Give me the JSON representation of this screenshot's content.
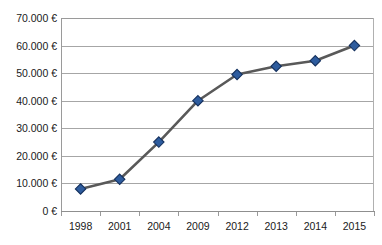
{
  "chart": {
    "title": "",
    "currency_symbol": "€",
    "series_name": "Betrag"
  },
  "chart_data": {
    "type": "line",
    "title": "",
    "xlabel": "",
    "ylabel": "",
    "categories": [
      "1998",
      "2001",
      "2004",
      "2009",
      "2012",
      "2013",
      "2014",
      "2015"
    ],
    "values": [
      8000,
      11500,
      25000,
      40000,
      49500,
      52500,
      54500,
      60000
    ],
    "value_labels": [
      "8.000 €",
      "11.500 €",
      "25.000 €",
      "40.000 €",
      "49.500 €",
      "52.500 €",
      "54.500 €",
      "60.000 €"
    ],
    "ylim": [
      0,
      70000
    ],
    "ytick_values": [
      70000,
      60000,
      50000,
      40000,
      30000,
      20000,
      10000,
      0
    ],
    "ytick_labels": [
      "70.000 €",
      "60.000 €",
      "50.000 €",
      "40.000 €",
      "30.000 €",
      "20.000 €",
      "10.000 €",
      "0 €"
    ],
    "grid": true,
    "grid_axis": "y",
    "legend": false,
    "legend_position": "none",
    "marker": "diamond",
    "series": [
      {
        "name": "Betrag",
        "values": [
          8000,
          11500,
          25000,
          40000,
          49500,
          52500,
          54500,
          60000
        ]
      }
    ]
  },
  "style": {
    "marker_fill": "#2e5c9e",
    "marker_edge": "#15315e",
    "line_color": "#595959",
    "grid_color": "#a6a6a6",
    "axis_color": "#9a9a9a",
    "text_color": "#1a1a1a",
    "background": "#ffffff"
  }
}
